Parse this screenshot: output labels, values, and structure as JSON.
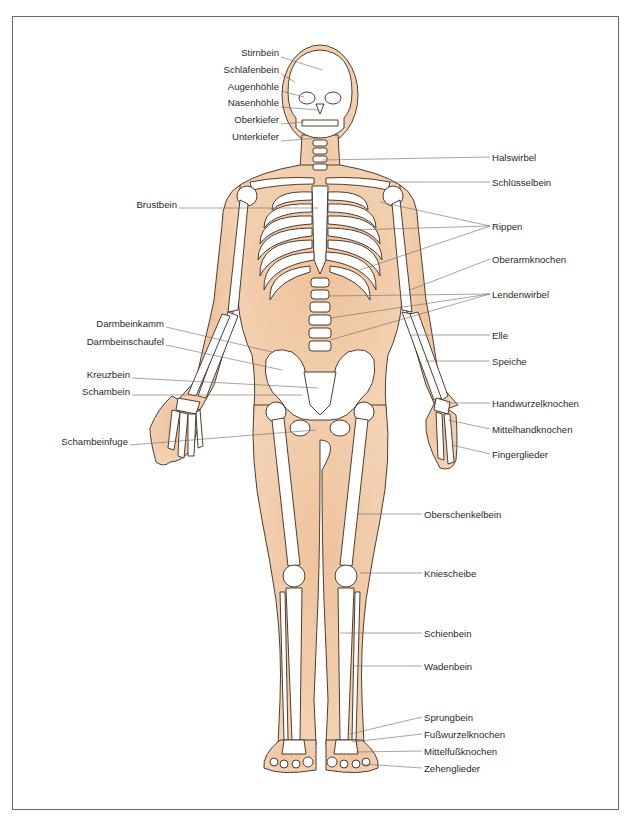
{
  "diagram": {
    "type": "anatomical skeleton diagram",
    "colors": {
      "skin": "#eec5a0",
      "skin_shadow": "#e2a57a",
      "bone": "#ffffff",
      "outline": "#3a2a1e",
      "leader_line": "#6a6a6a",
      "label_text": "#2a2a2a",
      "frame": "#6a6a6a"
    },
    "labels_left": [
      {
        "id": "stirnbein",
        "text": "Stirnbein",
        "x": 279,
        "y": 52
      },
      {
        "id": "schlaefenbein",
        "text": "Schläfenbein",
        "x": 279,
        "y": 69
      },
      {
        "id": "augenhoehle",
        "text": "Augenhöhle",
        "x": 279,
        "y": 86
      },
      {
        "id": "nasenhoehle",
        "text": "Nasenhöhle",
        "x": 279,
        "y": 102
      },
      {
        "id": "oberkiefer",
        "text": "Oberkiefer",
        "x": 279,
        "y": 119
      },
      {
        "id": "unterkiefer",
        "text": "Unterkiefer",
        "x": 279,
        "y": 136
      },
      {
        "id": "brustbein",
        "text": "Brustbein",
        "x": 177,
        "y": 204
      },
      {
        "id": "darmbeinkamm",
        "text": "Darmbeinkamm",
        "x": 164,
        "y": 323
      },
      {
        "id": "darmbeinschaufel",
        "text": "Darmbeinschaufel",
        "x": 164,
        "y": 341
      },
      {
        "id": "kreuzbein",
        "text": "Kreuzbein",
        "x": 130,
        "y": 374
      },
      {
        "id": "schambein",
        "text": "Schambein",
        "x": 130,
        "y": 391
      },
      {
        "id": "schambeinfuge",
        "text": "Schambeinfuge",
        "x": 128,
        "y": 441
      }
    ],
    "labels_right": [
      {
        "id": "halswirbel",
        "text": "Halswirbel",
        "x": 492,
        "y": 153
      },
      {
        "id": "schluesselbein",
        "text": "Schlüsselbein",
        "x": 492,
        "y": 178
      },
      {
        "id": "rippen",
        "text": "Rippen",
        "x": 492,
        "y": 222
      },
      {
        "id": "oberarmknochen",
        "text": "Oberarmknochen",
        "x": 492,
        "y": 255
      },
      {
        "id": "lendenwirbel",
        "text": "Lendenwirbel",
        "x": 492,
        "y": 290
      },
      {
        "id": "elle",
        "text": "Elle",
        "x": 492,
        "y": 331
      },
      {
        "id": "speiche",
        "text": "Speiche",
        "x": 492,
        "y": 357
      },
      {
        "id": "handwurzelknochen",
        "text": "Handwurzelknochen",
        "x": 492,
        "y": 399
      },
      {
        "id": "mittelhandknochen",
        "text": "Mittelhandknochen",
        "x": 492,
        "y": 425
      },
      {
        "id": "fingerglieder",
        "text": "Fingerglieder",
        "x": 492,
        "y": 450
      },
      {
        "id": "oberschenkelbein",
        "text": "Oberschenkelbein",
        "x": 424,
        "y": 510
      },
      {
        "id": "kniescheibe",
        "text": "Kniescheibe",
        "x": 424,
        "y": 569
      },
      {
        "id": "schienbein",
        "text": "Schienbein",
        "x": 424,
        "y": 629
      },
      {
        "id": "wadenbein",
        "text": "Wadenbein",
        "x": 424,
        "y": 662
      },
      {
        "id": "sprungbein",
        "text": "Sprungbein",
        "x": 424,
        "y": 713
      },
      {
        "id": "fusswurzelknochen",
        "text": "Fußwurzelknochen",
        "x": 424,
        "y": 730
      },
      {
        "id": "mittelfussknochen",
        "text": "Mittelfußknochen",
        "x": 424,
        "y": 747
      },
      {
        "id": "zehenglieder",
        "text": "Zehenglieder",
        "x": 424,
        "y": 764
      }
    ]
  }
}
